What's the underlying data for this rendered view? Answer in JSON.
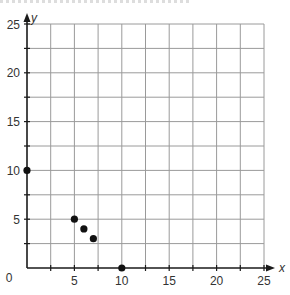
{
  "chart_data": {
    "type": "scatter",
    "title": "",
    "xlabel": "x",
    "ylabel": "y",
    "xlim": [
      0,
      25
    ],
    "ylim": [
      0,
      25
    ],
    "grid": true,
    "grid_step": 2.5,
    "x_ticks": [
      0,
      5,
      10,
      15,
      20,
      25
    ],
    "y_ticks": [
      5,
      10,
      15,
      20,
      25
    ],
    "origin_label": "0",
    "points": [
      {
        "x": 0,
        "y": 10
      },
      {
        "x": 5,
        "y": 5
      },
      {
        "x": 6,
        "y": 4
      },
      {
        "x": 7,
        "y": 3
      },
      {
        "x": 10,
        "y": 0
      }
    ],
    "colors": {
      "grid": "#9a9a9a",
      "axis": "#1a1a1a",
      "point": "#111111",
      "label": "#333333"
    }
  }
}
